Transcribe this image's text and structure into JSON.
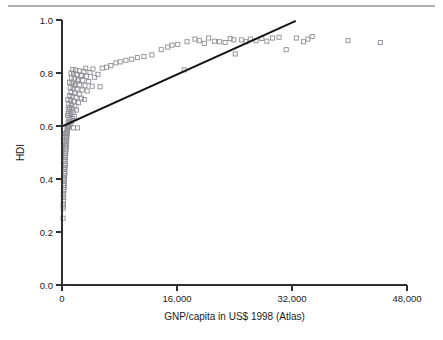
{
  "figure": {
    "name": "hdi-gnp-scatter",
    "has_top_rule": true,
    "background_color": "#ffffff",
    "marker_color": "#8e8e95",
    "line_color": "#141414",
    "axis_color": "#303030"
  },
  "chart_data": {
    "type": "scatter",
    "title": "",
    "xlabel": "GNP/capita in US$ 1998 (Atlas)",
    "ylabel": "HDI",
    "xlim": [
      0,
      48000
    ],
    "ylim": [
      0.0,
      1.0
    ],
    "xticks": [
      0,
      16000,
      32000,
      48000
    ],
    "xticklabels": [
      "0",
      "16,000",
      "32,000",
      "48,000"
    ],
    "yticks": [
      0.0,
      0.2,
      0.4,
      0.6,
      0.8,
      1.0
    ],
    "yticklabels": [
      "0.0",
      "0.2",
      "0.4",
      "0.6",
      "0.8",
      "1.0"
    ],
    "grid": false,
    "legend": null,
    "marker_style": "open-square",
    "trendline": {
      "type": "linear-fit",
      "x_start": 0,
      "y_start": 0.598,
      "x_end": 32400,
      "y_end": 0.995
    },
    "points": [
      [
        150,
        0.252
      ],
      [
        180,
        0.29
      ],
      [
        200,
        0.298
      ],
      [
        160,
        0.305
      ],
      [
        210,
        0.32
      ],
      [
        230,
        0.33
      ],
      [
        190,
        0.34
      ],
      [
        250,
        0.352
      ],
      [
        220,
        0.36
      ],
      [
        270,
        0.368
      ],
      [
        300,
        0.375
      ],
      [
        240,
        0.382
      ],
      [
        330,
        0.393
      ],
      [
        280,
        0.4
      ],
      [
        360,
        0.404
      ],
      [
        310,
        0.412
      ],
      [
        400,
        0.42
      ],
      [
        350,
        0.428
      ],
      [
        290,
        0.436
      ],
      [
        430,
        0.441
      ],
      [
        380,
        0.45
      ],
      [
        460,
        0.458
      ],
      [
        410,
        0.466
      ],
      [
        340,
        0.472
      ],
      [
        490,
        0.48
      ],
      [
        440,
        0.488
      ],
      [
        520,
        0.495
      ],
      [
        470,
        0.502
      ],
      [
        560,
        0.51
      ],
      [
        500,
        0.518
      ],
      [
        600,
        0.525
      ],
      [
        540,
        0.532
      ],
      [
        640,
        0.54
      ],
      [
        580,
        0.548
      ],
      [
        680,
        0.556
      ],
      [
        620,
        0.562
      ],
      [
        720,
        0.57
      ],
      [
        660,
        0.576
      ],
      [
        760,
        0.582
      ],
      [
        700,
        0.588
      ],
      [
        800,
        0.593
      ],
      [
        430,
        0.556
      ],
      [
        390,
        0.54
      ],
      [
        470,
        0.572
      ],
      [
        760,
        0.598
      ],
      [
        900,
        0.596
      ],
      [
        1600,
        0.593
      ],
      [
        2150,
        0.593
      ],
      [
        1000,
        0.604
      ],
      [
        1150,
        0.608
      ],
      [
        880,
        0.614
      ],
      [
        1320,
        0.618
      ],
      [
        980,
        0.624
      ],
      [
        1480,
        0.628
      ],
      [
        1080,
        0.632
      ],
      [
        1700,
        0.636
      ],
      [
        760,
        0.64
      ],
      [
        1250,
        0.645
      ],
      [
        930,
        0.648
      ],
      [
        1560,
        0.651
      ],
      [
        1130,
        0.656
      ],
      [
        2000,
        0.66
      ],
      [
        860,
        0.663
      ],
      [
        1400,
        0.667
      ],
      [
        1040,
        0.67
      ],
      [
        1800,
        0.675
      ],
      [
        1300,
        0.679
      ],
      [
        940,
        0.683
      ],
      [
        2300,
        0.688
      ],
      [
        1620,
        0.692
      ],
      [
        1180,
        0.696
      ],
      [
        820,
        0.7
      ],
      [
        2700,
        0.705
      ],
      [
        1950,
        0.708
      ],
      [
        1450,
        0.712
      ],
      [
        1080,
        0.715
      ],
      [
        3100,
        0.7
      ],
      [
        2400,
        0.72
      ],
      [
        1750,
        0.724
      ],
      [
        1250,
        0.727
      ],
      [
        3500,
        0.732
      ],
      [
        2800,
        0.736
      ],
      [
        2100,
        0.74
      ],
      [
        1550,
        0.743
      ],
      [
        1150,
        0.746
      ],
      [
        4200,
        0.75
      ],
      [
        3200,
        0.752
      ],
      [
        2450,
        0.755
      ],
      [
        1850,
        0.758
      ],
      [
        1400,
        0.762
      ],
      [
        1050,
        0.765
      ],
      [
        5300,
        0.748
      ],
      [
        3700,
        0.768
      ],
      [
        2900,
        0.772
      ],
      [
        2250,
        0.775
      ],
      [
        1700,
        0.778
      ],
      [
        1300,
        0.781
      ],
      [
        4500,
        0.784
      ],
      [
        3400,
        0.788
      ],
      [
        2650,
        0.791
      ],
      [
        2050,
        0.794
      ],
      [
        1600,
        0.797
      ],
      [
        1250,
        0.8
      ],
      [
        5000,
        0.795
      ],
      [
        3900,
        0.802
      ],
      [
        3050,
        0.806
      ],
      [
        2400,
        0.808
      ],
      [
        1900,
        0.811
      ],
      [
        1500,
        0.813
      ],
      [
        4300,
        0.815
      ],
      [
        3300,
        0.818
      ],
      [
        6200,
        0.822
      ],
      [
        2750,
        0.79
      ],
      [
        2200,
        0.77
      ],
      [
        1800,
        0.752
      ],
      [
        7500,
        0.838
      ],
      [
        8100,
        0.842
      ],
      [
        8900,
        0.848
      ],
      [
        9700,
        0.852
      ],
      [
        10500,
        0.858
      ],
      [
        11400,
        0.862
      ],
      [
        12500,
        0.868
      ],
      [
        6800,
        0.828
      ],
      [
        5600,
        0.818
      ],
      [
        13800,
        0.888
      ],
      [
        14700,
        0.898
      ],
      [
        15300,
        0.905
      ],
      [
        16100,
        0.908
      ],
      [
        17400,
        0.918
      ],
      [
        18500,
        0.928
      ],
      [
        19100,
        0.922
      ],
      [
        19800,
        0.912
      ],
      [
        20400,
        0.932
      ],
      [
        21200,
        0.92
      ],
      [
        21900,
        0.918
      ],
      [
        22700,
        0.915
      ],
      [
        17000,
        0.812
      ],
      [
        24100,
        0.872
      ],
      [
        25000,
        0.925
      ],
      [
        25600,
        0.918
      ],
      [
        26200,
        0.928
      ],
      [
        27000,
        0.922
      ],
      [
        27800,
        0.93
      ],
      [
        28500,
        0.92
      ],
      [
        29300,
        0.932
      ],
      [
        30200,
        0.935
      ],
      [
        31200,
        0.888
      ],
      [
        32600,
        0.932
      ],
      [
        33600,
        0.918
      ],
      [
        34200,
        0.928
      ],
      [
        34800,
        0.938
      ],
      [
        39800,
        0.922
      ],
      [
        44300,
        0.915
      ],
      [
        23400,
        0.93
      ],
      [
        23900,
        0.925
      ]
    ]
  }
}
